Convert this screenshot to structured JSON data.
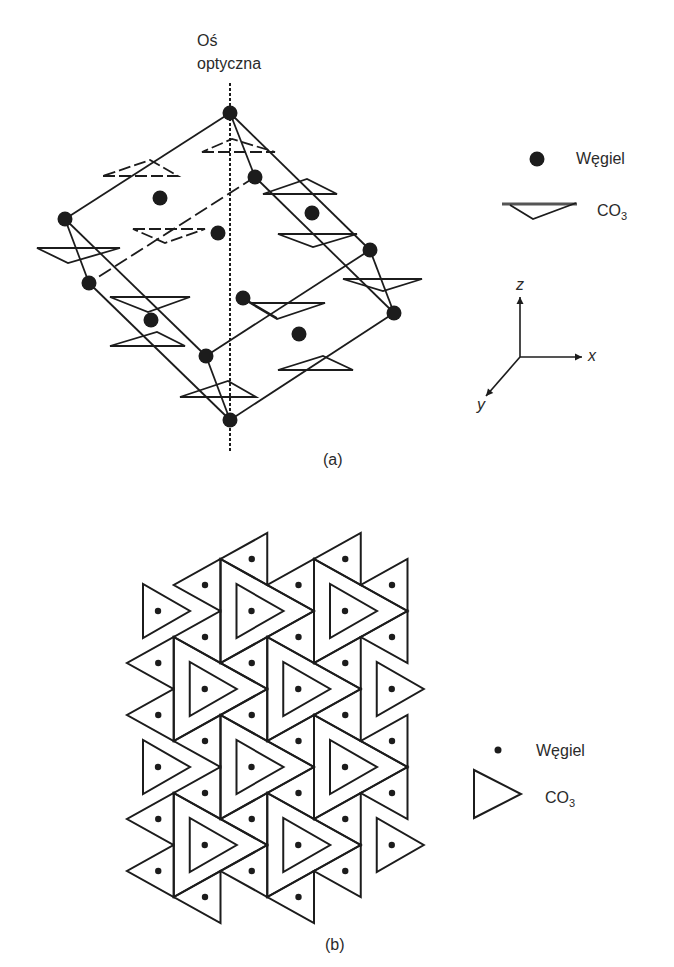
{
  "panel_a": {
    "caption": "(a)",
    "optical_axis": {
      "label_line1": "Oś",
      "label_line2": "optyczna",
      "x": 230,
      "y1": 83,
      "y2": 452
    },
    "legend": {
      "carbon_label": "Węgiel",
      "co3_label": "CO",
      "co3_sub": "3"
    },
    "axes": {
      "origin": [
        520,
        357
      ],
      "z": {
        "label": "z",
        "end": [
          520,
          297
        ]
      },
      "x": {
        "label": "x",
        "end": [
          582,
          357
        ]
      },
      "y": {
        "label": "y",
        "end": [
          486,
          396
        ]
      }
    },
    "atoms": [
      [
        230,
        113
      ],
      [
        255,
        177
      ],
      [
        160,
        198
      ],
      [
        65,
        219
      ],
      [
        218,
        233
      ],
      [
        312,
        213
      ],
      [
        89,
        283
      ],
      [
        370,
        250
      ],
      [
        243,
        298
      ],
      [
        151,
        320
      ],
      [
        299,
        334
      ],
      [
        394,
        313
      ],
      [
        206,
        356
      ],
      [
        230,
        420
      ]
    ],
    "edges": [
      {
        "a": [
          230,
          113
        ],
        "b": [
          65,
          219
        ],
        "dashed": false
      },
      {
        "a": [
          230,
          113
        ],
        "b": [
          255,
          177
        ],
        "dashed": false
      },
      {
        "a": [
          230,
          113
        ],
        "b": [
          370,
          250
        ],
        "dashed": false
      },
      {
        "a": [
          65,
          219
        ],
        "b": [
          89,
          283
        ],
        "dashed": false
      },
      {
        "a": [
          65,
          219
        ],
        "b": [
          206,
          356
        ],
        "dashed": false
      },
      {
        "a": [
          255,
          177
        ],
        "b": [
          89,
          283
        ],
        "dashed": true
      },
      {
        "a": [
          255,
          177
        ],
        "b": [
          394,
          313
        ],
        "dashed": false
      },
      {
        "a": [
          370,
          250
        ],
        "b": [
          394,
          313
        ],
        "dashed": false
      },
      {
        "a": [
          370,
          250
        ],
        "b": [
          206,
          356
        ],
        "dashed": false
      },
      {
        "a": [
          89,
          283
        ],
        "b": [
          230,
          420
        ],
        "dashed": false
      },
      {
        "a": [
          206,
          356
        ],
        "b": [
          230,
          420
        ],
        "dashed": false
      },
      {
        "a": [
          394,
          313
        ],
        "b": [
          230,
          420
        ],
        "dashed": false
      },
      {
        "a": [
          243,
          298
        ],
        "b": [
          277,
          318
        ],
        "dashed": false
      }
    ],
    "co3_groups": [
      {
        "p": [
          [
            202,
            152
          ],
          [
            275,
            152
          ],
          [
            232,
            139
          ]
        ],
        "dashed": true
      },
      {
        "p": [
          [
            103,
            176
          ],
          [
            178,
            176
          ],
          [
            150,
            160
          ]
        ],
        "dashed": true
      },
      {
        "p": [
          [
            37,
            248
          ],
          [
            120,
            248
          ],
          [
            68,
            263
          ]
        ],
        "dashed": false
      },
      {
        "p": [
          [
            133,
            229
          ],
          [
            205,
            229
          ],
          [
            165,
            243
          ]
        ],
        "dashed": true
      },
      {
        "p": [
          [
            263,
            194
          ],
          [
            337,
            194
          ],
          [
            307,
            179
          ]
        ],
        "dashed": false
      },
      {
        "p": [
          [
            278,
            234
          ],
          [
            357,
            234
          ],
          [
            313,
            247
          ]
        ],
        "dashed": false
      },
      {
        "p": [
          [
            343,
            279
          ],
          [
            422,
            279
          ],
          [
            383,
            291
          ]
        ],
        "dashed": false
      },
      {
        "p": [
          [
            110,
            297
          ],
          [
            190,
            297
          ],
          [
            148,
            312
          ]
        ],
        "dashed": false
      },
      {
        "p": [
          [
            110,
            346
          ],
          [
            185,
            346
          ],
          [
            157,
            332
          ]
        ],
        "dashed": false
      },
      {
        "p": [
          [
            250,
            303
          ],
          [
            325,
            303
          ],
          [
            277,
            319
          ]
        ],
        "dashed": false
      },
      {
        "p": [
          [
            278,
            370
          ],
          [
            353,
            370
          ],
          [
            323,
            356
          ]
        ],
        "dashed": false
      },
      {
        "p": [
          [
            180,
            397
          ],
          [
            256,
            397
          ],
          [
            228,
            381
          ]
        ],
        "dashed": false
      }
    ]
  },
  "panel_b": {
    "caption": "(b)",
    "legend": {
      "carbon_label": "Węgiel",
      "co3_label": "CO",
      "co3_sub": "3"
    },
    "lattice": {
      "x0": 127,
      "dx": 46.75,
      "cell_v": 52,
      "large_triangles": [
        {
          "i": 2,
          "top": 559
        },
        {
          "i": 4,
          "top": 559
        },
        {
          "i": 1,
          "top": 637
        },
        {
          "i": 3,
          "top": 637
        },
        {
          "i": 2,
          "top": 715
        },
        {
          "i": 4,
          "top": 715
        },
        {
          "i": 1,
          "top": 793
        },
        {
          "i": 3,
          "top": 793
        }
      ],
      "inner_only": [
        {
          "i": 0,
          "top": 559
        },
        {
          "i": 0,
          "top": 715
        },
        {
          "i": 5,
          "top": 637
        },
        {
          "i": 5,
          "top": 793
        }
      ],
      "small_triangles": [
        {
          "strip": 0,
          "centers": [
            663,
            715,
            819,
            871
          ]
        },
        {
          "strip": 1,
          "centers": [
            585,
            637,
            741,
            793,
            897
          ]
        },
        {
          "strip": 2,
          "centers": [
            559,
            663,
            715,
            819,
            871
          ]
        },
        {
          "strip": 3,
          "centers": [
            585,
            637,
            741,
            793,
            897
          ]
        },
        {
          "strip": 4,
          "centers": [
            559,
            663,
            715,
            819,
            871
          ]
        },
        {
          "strip": 5,
          "centers": [
            585,
            637,
            741,
            793
          ]
        }
      ]
    }
  },
  "colors": {
    "ink": "#1c1c1c",
    "text": "#2a2a2a",
    "background": "#ffffff"
  }
}
